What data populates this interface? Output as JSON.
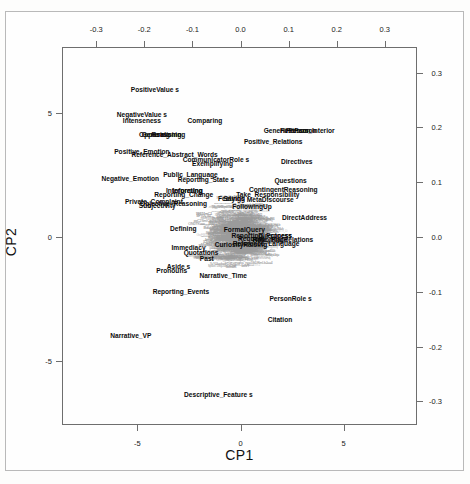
{
  "figure": {
    "type": "correspondence-analysis-biplot",
    "xlabel": "CP1",
    "ylabel": "CP2"
  },
  "axes": {
    "top": {
      "name": "column-coordinate-axis-x",
      "ticks": [
        "-0.3",
        "-0.2",
        "-0.1",
        "0.0",
        "0.1",
        "0.2",
        "0.3"
      ],
      "values": [
        -0.3,
        -0.2,
        -0.1,
        0.0,
        0.1,
        0.2,
        0.3
      ],
      "range": [
        -0.369,
        0.369
      ]
    },
    "right": {
      "name": "column-coordinate-axis-y",
      "ticks": [
        "0.3",
        "0.2",
        "0.1",
        "0.0",
        "-0.1",
        "-0.2",
        "-0.3"
      ],
      "values": [
        0.3,
        0.2,
        0.1,
        0.0,
        -0.1,
        -0.2,
        -0.3
      ],
      "range": [
        -0.345,
        0.345
      ]
    },
    "bottom": {
      "name": "row-coordinate-axis-x",
      "ticks": [
        "-5",
        "0",
        "5"
      ],
      "values": [
        -5,
        0,
        5
      ],
      "range": [
        -8.6,
        8.6
      ]
    },
    "left": {
      "name": "row-coordinate-axis-y",
      "ticks": [
        "5",
        "0",
        "-5"
      ],
      "values": [
        5,
        0,
        -5
      ],
      "range": [
        -7.6,
        7.6
      ]
    }
  },
  "chart_data": {
    "type": "scatter",
    "title": "",
    "subtitle": "",
    "xlabel": "CP1",
    "ylabel": "CP2",
    "grid": false,
    "legend": null,
    "xlim": [
      -0.369,
      0.369
    ],
    "ylim": [
      -0.345,
      0.345
    ],
    "xlim_rows": [
      -8.6,
      8.6
    ],
    "ylim_rows": [
      -7.6,
      7.6
    ],
    "series": [
      {
        "name": "column-points",
        "marker": "text-label",
        "color": "#0b0b0b",
        "points": [
          {
            "label": "PositiveValue s",
            "x": -0.178,
            "y": 0.268
          },
          {
            "label": "NegativeValue s",
            "x": -0.205,
            "y": 0.222
          },
          {
            "label": "Intenseness",
            "x": -0.205,
            "y": 0.211
          },
          {
            "label": "Opposing",
            "x": -0.179,
            "y": 0.186
          },
          {
            "label": "Generalising",
            "x": -0.164,
            "y": 0.186
          },
          {
            "label": "Reasoning",
            "x": -0.15,
            "y": 0.186
          },
          {
            "label": "Positive_Emotion",
            "x": -0.205,
            "y": 0.155
          },
          {
            "label": "Reference_Abstract_Words",
            "x": -0.137,
            "y": 0.15
          },
          {
            "label": "Comparing",
            "x": -0.074,
            "y": 0.212
          },
          {
            "label": "GenericPerson",
            "x": 0.097,
            "y": 0.193
          },
          {
            "label": "FirstPerson",
            "x": 0.12,
            "y": 0.193
          },
          {
            "label": "Person_Interior",
            "x": 0.145,
            "y": 0.193
          },
          {
            "label": "Positive_Relations",
            "x": 0.068,
            "y": 0.173
          },
          {
            "label": "CommunicatorRole s",
            "x": -0.051,
            "y": 0.14
          },
          {
            "label": "Exemplifying",
            "x": -0.058,
            "y": 0.133
          },
          {
            "label": "Directives",
            "x": 0.117,
            "y": 0.136
          },
          {
            "label": "Public_Language",
            "x": -0.104,
            "y": 0.113
          },
          {
            "label": "Negative_Emotion",
            "x": -0.229,
            "y": 0.105
          },
          {
            "label": "Reporting_State s",
            "x": -0.072,
            "y": 0.104
          },
          {
            "label": "Questions",
            "x": 0.104,
            "y": 0.103
          },
          {
            "label": "Interpreting",
            "x": -0.117,
            "y": 0.084
          },
          {
            "label": "Informing",
            "x": -0.11,
            "y": 0.084
          },
          {
            "label": "ContingentReasoning",
            "x": 0.089,
            "y": 0.085
          },
          {
            "label": "Reporting_Change",
            "x": -0.118,
            "y": 0.077
          },
          {
            "label": "Take_Responsibility",
            "x": 0.057,
            "y": 0.077
          },
          {
            "label": "Feelings",
            "x": -0.019,
            "y": 0.07
          },
          {
            "label": "Saying",
            "x": -0.013,
            "y": 0.07
          },
          {
            "label": "MetaDiscourse",
            "x": 0.062,
            "y": 0.068
          },
          {
            "label": "Private_Complaint",
            "x": -0.18,
            "y": 0.063
          },
          {
            "label": "Subjectivity",
            "x": -0.173,
            "y": 0.056
          },
          {
            "label": "Objective_Reasoning",
            "x": -0.139,
            "y": 0.06
          },
          {
            "label": "FollowingUp",
            "x": 0.024,
            "y": 0.055
          },
          {
            "label": "DirectAddress",
            "x": 0.133,
            "y": 0.035
          },
          {
            "label": "Defining",
            "x": -0.119,
            "y": 0.014
          },
          {
            "label": "FormalQuery",
            "x": 0.008,
            "y": 0.012
          },
          {
            "label": "Reporting_Process",
            "x": 0.044,
            "y": 0.002
          },
          {
            "label": "Directness",
            "x": 0.072,
            "y": 0.002
          },
          {
            "label": "Request",
            "x": 0.022,
            "y": -0.004
          },
          {
            "label": "Time_Place",
            "x": 0.061,
            "y": -0.005
          },
          {
            "label": "ReportingRelations",
            "x": 0.088,
            "y": -0.005
          },
          {
            "label": "Reference_Language",
            "x": 0.053,
            "y": -0.012
          },
          {
            "label": "CuriosityRaising",
            "x": 0.001,
            "y": -0.015
          },
          {
            "label": "Immediacy",
            "x": -0.108,
            "y": -0.02
          },
          {
            "label": "Quotations",
            "x": -0.082,
            "y": -0.029
          },
          {
            "label": "Past",
            "x": -0.07,
            "y": -0.04
          },
          {
            "label": "Aside s",
            "x": -0.129,
            "y": -0.054
          },
          {
            "label": "Pronouns",
            "x": -0.143,
            "y": -0.062
          },
          {
            "label": "Narrative_Time",
            "x": -0.036,
            "y": -0.071
          },
          {
            "label": "PersonRole s",
            "x": 0.104,
            "y": -0.113
          },
          {
            "label": "Reporting_Events",
            "x": -0.124,
            "y": -0.101
          },
          {
            "label": "Citation",
            "x": 0.082,
            "y": -0.151
          },
          {
            "label": "Narrative_VP",
            "x": -0.228,
            "y": -0.181
          },
          {
            "label": "Descriptive_Feature s",
            "x": -0.046,
            "y": -0.288
          }
        ]
      },
      {
        "name": "row-points",
        "marker": "text-label-small",
        "color": "#9b9b9b",
        "note": "dense unreadable microtext of row/document labels forming the central cloud"
      }
    ]
  }
}
